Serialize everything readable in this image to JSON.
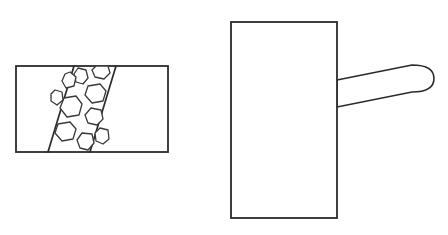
{
  "document": {
    "title": "Technical Line Drawing",
    "background_color": "#ffffff",
    "line_color": "#2b2b2b",
    "detail_line_color": "#3a3a3a",
    "width": 448,
    "height": 235
  },
  "figures": [
    {
      "id": "left-figure",
      "name": "sectioned-rectangle-with-aggregate-band",
      "description": "Horizontal rectangle containing a diagonal band filled with irregular hexagonal aggregate shapes",
      "rect": {
        "x": 16,
        "y": 66,
        "width": 152,
        "height": 86
      },
      "band": {
        "name": "diagonal-aggregate-band",
        "top_left_x": 74,
        "top_right_x": 116,
        "bottom_left_x": 48,
        "bottom_right_x": 90,
        "top_y": 66,
        "bottom_y": 152
      },
      "aggregates": [
        {
          "name": "aggregate-1",
          "points": "78,68 86,70 88,78 83,84 76,82 74,74"
        },
        {
          "name": "aggregate-2",
          "points": "96,66 108,66 110,73 104,79 95,77 92,70"
        },
        {
          "name": "aggregate-3",
          "points": "88,86 100,84 106,91 103,101 92,103 85,95"
        },
        {
          "name": "aggregate-4",
          "points": "64,98 76,96 82,104 79,115 67,117 60,108"
        },
        {
          "name": "aggregate-5",
          "points": "91,108 101,110 103,119 97,125 88,123 85,115"
        },
        {
          "name": "aggregate-6",
          "points": "58,124 70,122 76,129 73,139 62,141 55,133"
        },
        {
          "name": "aggregate-7",
          "points": "82,133 92,134 94,143 88,150 80,148 77,140"
        },
        {
          "name": "aggregate-8",
          "points": "70,72 76,77 74,86 66,88 62,81 65,74"
        },
        {
          "name": "aggregate-9",
          "points": "100,128 108,130 109,139 103,144 96,141 95,133"
        },
        {
          "name": "aggregate-10",
          "points": "55,90 62,92 63,100 57,105 51,101 51,94"
        }
      ]
    },
    {
      "id": "right-figure",
      "name": "rectangle-with-tapered-handle",
      "description": "Tall vertical rectangle with a tapered rounded handle extending to the right",
      "rect": {
        "x": 231,
        "y": 22,
        "width": 106,
        "height": 196
      },
      "handle": {
        "name": "tapered-rounded-handle",
        "attach_top_y": 80,
        "attach_bottom_y": 107,
        "tip_top_y": 65,
        "tip_bottom_y": 92,
        "attach_x": 337,
        "tip_x": 434,
        "path": "M337,80 L412,65 Q434,65 434,78.5 Q434,92 412,92 L337,107 Z"
      }
    }
  ]
}
